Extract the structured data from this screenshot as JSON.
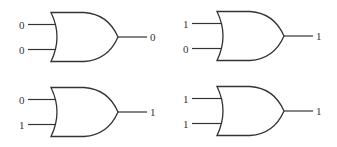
{
  "diagram": {
    "gate_type": "OR",
    "line_color": "#333333",
    "gates": [
      {
        "id": "gate-1",
        "input_a": "0",
        "input_b": "0",
        "output": "0"
      },
      {
        "id": "gate-2",
        "input_a": "1",
        "input_b": "0",
        "output": "1"
      },
      {
        "id": "gate-3",
        "input_a": "0",
        "input_b": "1",
        "output": "1"
      },
      {
        "id": "gate-4",
        "input_a": "1",
        "input_b": "1",
        "output": "1"
      }
    ]
  }
}
